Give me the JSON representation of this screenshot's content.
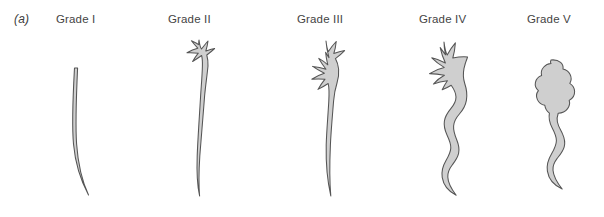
{
  "figure": {
    "panel_label": "(a)",
    "background_color": "#ffffff",
    "structure_fill_color": "#cfcfcf",
    "structure_stroke_color": "#555555",
    "label_text_color": "#444444"
  },
  "grades": [
    {
      "id": "grade-1",
      "label": "Grade I",
      "label_x": 56,
      "description": "reflux into non-dilated distal ureter only",
      "ureter": "thin, narrow, slightly curved",
      "calyces": "none shown",
      "pelvis": "none shown"
    },
    {
      "id": "grade-2",
      "label": "Grade II",
      "label_x": 168,
      "description": "reflux into pelvis and calyces without dilatation",
      "ureter": "thin, narrow, long curve",
      "calyces": "sharp, pointed fornices",
      "pelvis": "small, non-dilated"
    },
    {
      "id": "grade-3",
      "label": "Grade III",
      "label_x": 297,
      "description": "mild dilatation of ureter, pelvis and calyces",
      "ureter": "mildly dilated, gently tortuous",
      "calyces": "mildly blunted",
      "pelvis": "mildly dilated"
    },
    {
      "id": "grade-4",
      "label": "Grade IV",
      "label_x": 419,
      "description": "moderate ureteral tortuosity and pelvicalyceal dilatation",
      "ureter": "moderately dilated and tortuous",
      "calyces": "blunted, rounded fornices",
      "pelvis": "moderately dilated"
    },
    {
      "id": "grade-5",
      "label": "Grade V",
      "label_x": 527,
      "description": "gross dilatation, tortuosity and loss of papillary impressions",
      "ureter": "grossly dilated and tortuous",
      "calyces": "effaced, ballooned",
      "pelvis": "grossly dilated"
    }
  ]
}
